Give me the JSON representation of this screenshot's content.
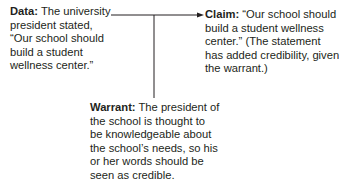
{
  "diagram": {
    "data": {
      "label": "Data:",
      "text": " The university president stated, “Our school should build a student wellness center.”"
    },
    "claim": {
      "label": "Claim:",
      "text": " “Our school should build a student wellness center.” (The statement has added credibility, given the warrant.)"
    },
    "warrant": {
      "label": "Warrant:",
      "text": " The president of the school is thought to be knowledgeable about the school’s needs, so his or her words should be seen as credible."
    },
    "colors": {
      "text": "#231f20",
      "line": "#231f20"
    }
  }
}
